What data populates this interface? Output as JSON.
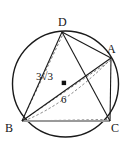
{
  "figure": {
    "vertices": [
      {
        "name": "D",
        "label": "D",
        "x": 62,
        "y": 32,
        "label_x": 58,
        "label_y": 25
      },
      {
        "name": "A",
        "label": "A",
        "x": 111,
        "y": 58,
        "label_x": 108,
        "label_y": 52
      },
      {
        "name": "C",
        "label": "C",
        "x": 110,
        "y": 121,
        "label_x": 112,
        "label_y": 131
      },
      {
        "name": "B",
        "label": "B",
        "x": 22,
        "y": 121,
        "label_x": 6,
        "label_y": 131
      }
    ],
    "circle": {
      "cx": 65.5,
      "cy": 84,
      "r": 53,
      "stroke": "#1a1a1a"
    },
    "center_dot": {
      "cx": 64,
      "cy": 83,
      "r": 2
    },
    "measures": [
      {
        "name": "segment-bd-length",
        "text": "3√3",
        "x": 37,
        "y": 79
      },
      {
        "name": "segment-ba-length",
        "text": "6",
        "x": 63,
        "y": 102
      }
    ],
    "solid_edges": [
      {
        "name": "edge-b-d",
        "x1": 22,
        "y1": 121,
        "x2": 62,
        "y2": 32
      },
      {
        "name": "edge-d-a",
        "x1": 62,
        "y1": 32,
        "x2": 111,
        "y2": 58
      },
      {
        "name": "edge-a-c",
        "x1": 111,
        "y1": 58,
        "x2": 110,
        "y2": 121
      },
      {
        "name": "edge-d-c",
        "x1": 62,
        "y1": 32,
        "x2": 110,
        "y2": 121
      },
      {
        "name": "diagonal-b-a",
        "x1": 22,
        "y1": 121,
        "x2": 111,
        "y2": 58
      }
    ],
    "base_edge": {
      "name": "edge-b-c",
      "x1": 22,
      "y1": 121,
      "x2": 110,
      "y2": 121,
      "stroke": "#9a9a9a"
    },
    "dashed_edges": [
      {
        "name": "dashed-b-d-inner",
        "x1": 22,
        "y1": 121,
        "x2": 63,
        "y2": 33
      },
      {
        "name": "dashed-b-c-arcline",
        "x1": 22,
        "y1": 121,
        "x2": 110,
        "y2": 120
      },
      {
        "name": "dashed-b-a-lower",
        "x1": 22,
        "y1": 121,
        "x2": 111,
        "y2": 60
      }
    ],
    "dashed_curve": {
      "name": "dashed-arc-b-to-a",
      "path": "M 24 121 Q 66 104 110 60"
    },
    "colors": {
      "ink": "#1a1a1a",
      "base": "#9a9a9a",
      "dash": "#6e6e6e",
      "background": "#ffffff"
    }
  }
}
